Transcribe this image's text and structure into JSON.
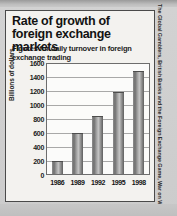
{
  "figure": {
    "title": "Rate of growth of foreign exchange markets",
    "subtitle": "Figures for daily turnover in foreign exchange trading",
    "credit": "The Global Gamblers, British Banks and the Foreign Exchange Game, War on Want, 1998."
  },
  "chart_data": {
    "type": "bar",
    "title": "Rate of growth of foreign exchange markets",
    "subtitle": "Figures for daily turnover in foreign exchange trading",
    "categories": [
      "1986",
      "1989",
      "1992",
      "1995",
      "1998"
    ],
    "values": [
      190,
      590,
      840,
      1190,
      1500
    ],
    "xlabel": "",
    "ylabel": "Billions of dollars",
    "ylim": [
      0,
      1600
    ],
    "ytick_labels": [
      "1600",
      "1400",
      "1200",
      "1000",
      "800",
      "600",
      "400",
      "200",
      "0"
    ],
    "ytick_values": [
      1600,
      1400,
      1200,
      1000,
      800,
      600,
      400,
      200,
      0
    ],
    "grid": true,
    "legend": "none",
    "bar_color": "#8d8d8d",
    "background_color": "#fbfbfa"
  }
}
